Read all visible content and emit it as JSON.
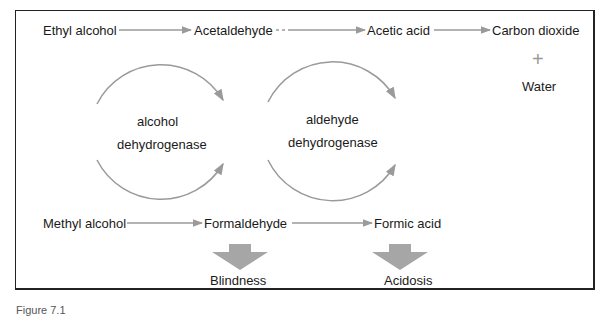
{
  "diagram": {
    "row_top": {
      "ethyl_alcohol": "Ethyl alcohol",
      "acetaldehyde": "Acetaldehyde",
      "acetic_acid": "Acetic acid",
      "carbon_dioxide": "Carbon dioxide",
      "plus": "+",
      "water": "Water"
    },
    "enzymes": {
      "enzyme1_line1": "alcohol",
      "enzyme1_line2": "dehydrogenase",
      "enzyme2_line1": "aldehyde",
      "enzyme2_line2": "dehydrogenase"
    },
    "row_bottom": {
      "methyl_alcohol": "Methyl alcohol",
      "formaldehyde": "Formaldehyde",
      "formic_acid": "Formic acid"
    },
    "outcomes": {
      "blindness": "Blindness",
      "acidosis": "Acidosis"
    },
    "colors": {
      "arrow": "#9a9a9a",
      "block_arrow": "#a6a6a6",
      "text": "#1a1a1a",
      "frame": "#222222"
    }
  },
  "caption": "Figure 7.1"
}
